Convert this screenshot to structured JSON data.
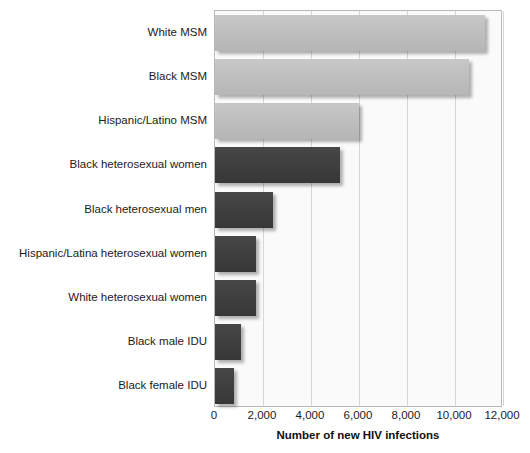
{
  "chart_data": {
    "type": "bar",
    "orientation": "horizontal",
    "title": "",
    "xlabel": "Number of new HIV infections",
    "ylabel": "",
    "xlim": [
      0,
      12000
    ],
    "xticks": [
      "0",
      "2,000",
      "4,000",
      "6,000",
      "8,000",
      "10,000",
      "12,000"
    ],
    "xtick_values": [
      0,
      2000,
      4000,
      6000,
      8000,
      10000,
      12000
    ],
    "grid": true,
    "legend": "none",
    "categories": [
      "White MSM",
      "Black MSM",
      "Hispanic/Latino MSM",
      "Black heterosexual women",
      "Black heterosexual men",
      "Hispanic/Latina heterosexual women",
      "White heterosexual women",
      "Black male IDU",
      "Black female IDU"
    ],
    "values": [
      11250,
      10600,
      6000,
      5200,
      2400,
      1700,
      1700,
      1100,
      800
    ],
    "bar_colors": [
      "#bdbdbd",
      "#bdbdbd",
      "#bdbdbd",
      "#3e3e3e",
      "#3e3e3e",
      "#3e3e3e",
      "#3e3e3e",
      "#3e3e3e",
      "#3e3e3e"
    ],
    "bar_groups": [
      "light",
      "light",
      "light",
      "dark",
      "dark",
      "dark",
      "dark",
      "dark",
      "dark"
    ]
  },
  "colors": {
    "background": "#ffffff",
    "plot_background": "#fafafa",
    "gridline": "#d6d6d6",
    "axis_border": "#b9b9b9",
    "light_bar": "#bdbdbd",
    "dark_bar": "#3e3e3e",
    "text": "#1b1b1b"
  }
}
